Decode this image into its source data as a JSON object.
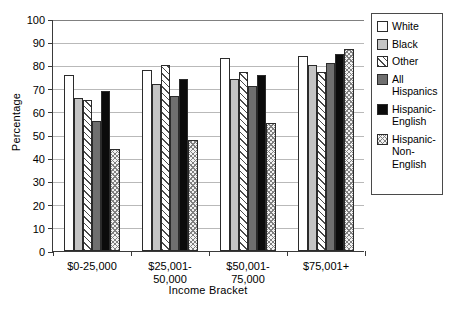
{
  "chart_data": {
    "type": "bar",
    "title": "",
    "xlabel": "Income Bracket",
    "ylabel": "Percentage",
    "ylim": [
      0,
      100
    ],
    "ytick_labels": [
      "0",
      "10",
      "20",
      "30",
      "40",
      "50",
      "60",
      "70",
      "80",
      "90",
      "100"
    ],
    "yticks": [
      0,
      10,
      20,
      30,
      40,
      50,
      60,
      70,
      80,
      90,
      100
    ],
    "grid": true,
    "legend_position": "right",
    "categories": [
      "$0-25,000",
      "$25,001-\n50,000",
      "$50,001-\n75,000",
      "$75,001+"
    ],
    "series": [
      {
        "name": "White",
        "pattern": "solid-white",
        "values": [
          76,
          78,
          83,
          84
        ]
      },
      {
        "name": "Black",
        "pattern": "solid-light-gray",
        "values": [
          66,
          72,
          74,
          80
        ]
      },
      {
        "name": "Other",
        "pattern": "diagonal-hatch",
        "values": [
          65,
          80,
          77,
          77
        ]
      },
      {
        "name": "All Hispanics",
        "pattern": "solid-dark-gray",
        "values": [
          56,
          67,
          71,
          81
        ]
      },
      {
        "name": "Hispanic-English",
        "pattern": "solid-black",
        "values": [
          69,
          74,
          76,
          85
        ]
      },
      {
        "name": "Hispanic-Non-English",
        "pattern": "cross-hatch",
        "values": [
          44,
          48,
          55,
          87
        ]
      }
    ]
  },
  "legend": {
    "items": [
      {
        "label": "White"
      },
      {
        "label": "Black"
      },
      {
        "label": "Other"
      },
      {
        "label": "All\nHispanics"
      },
      {
        "label": "Hispanic-\nEnglish"
      },
      {
        "label": "Hispanic-\nNon-\nEnglish"
      }
    ]
  },
  "colors": {
    "white": "#ffffff",
    "black_series": "#c4c4c4",
    "all_hispanics": "#6f6f6f",
    "hispanic_english": "#0b0b0b",
    "grid": "#b9b9b9",
    "axis": "#3a3a3a"
  }
}
